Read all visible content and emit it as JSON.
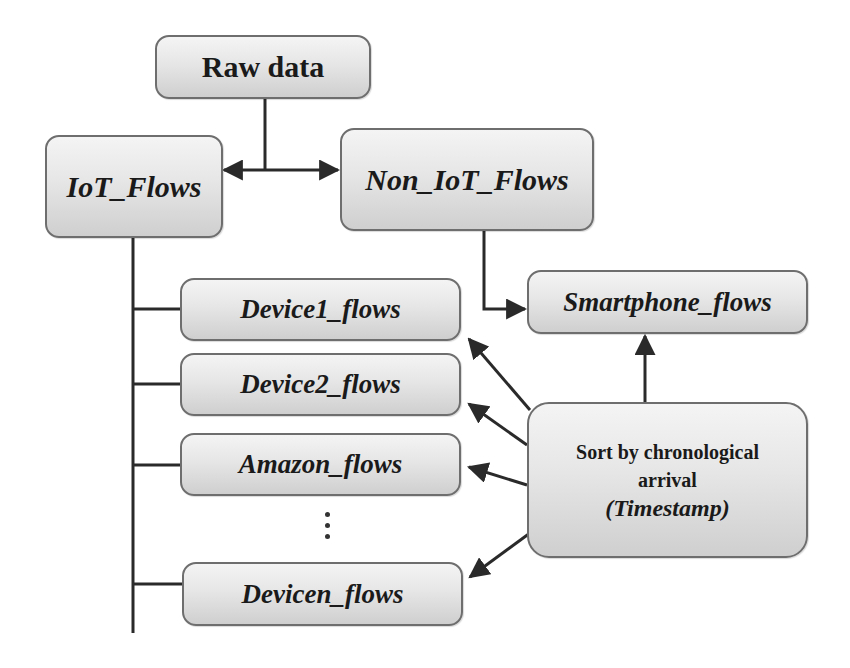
{
  "diagram": {
    "nodes": {
      "raw_data": "Raw data",
      "iot_flows": "IoT_Flows",
      "non_iot_flows": "Non_IoT_Flows",
      "device1_flows": "Device1_flows",
      "device2_flows": "Device2_flows",
      "amazon_flows": "Amazon_flows",
      "devicen_flows": "Devicen_flows",
      "smartphone_flows": "Smartphone_flows",
      "sort_line1": "Sort by chronological",
      "sort_line2": "arrival",
      "sort_line3": "(Timestamp)"
    },
    "ellipsis": "⋮",
    "edges": [
      {
        "from": "raw_data",
        "to": "iot_flows"
      },
      {
        "from": "raw_data",
        "to": "non_iot_flows"
      },
      {
        "from": "iot_flows",
        "to": "device1_flows"
      },
      {
        "from": "iot_flows",
        "to": "device2_flows"
      },
      {
        "from": "iot_flows",
        "to": "amazon_flows"
      },
      {
        "from": "iot_flows",
        "to": "devicen_flows"
      },
      {
        "from": "non_iot_flows",
        "to": "smartphone_flows"
      },
      {
        "from": "sort",
        "to": "device1_flows"
      },
      {
        "from": "sort",
        "to": "device2_flows"
      },
      {
        "from": "sort",
        "to": "amazon_flows"
      },
      {
        "from": "sort",
        "to": "devicen_flows"
      },
      {
        "from": "sort",
        "to": "smartphone_flows"
      }
    ],
    "colors": {
      "box_border": "#6e6e6e",
      "box_fill_top": "#f4f4f4",
      "box_fill_bottom": "#cfcfcf",
      "line": "#2a2a2a",
      "text": "#1a1a1a"
    }
  }
}
